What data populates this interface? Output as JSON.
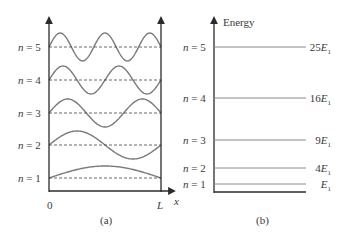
{
  "panel_a": {
    "caption": "(a)",
    "x_origin_label": "0",
    "x_end_label": "L",
    "x_axis_label": "x",
    "levels": [
      {
        "n": 1,
        "label_n": "n",
        "label_eq": " = 1",
        "baseline_y": 178,
        "half_waves": 1,
        "amplitude": 12
      },
      {
        "n": 2,
        "label_n": "n",
        "label_eq": " = 2",
        "baseline_y": 145,
        "half_waves": 2,
        "amplitude": 14
      },
      {
        "n": 3,
        "label_n": "n",
        "label_eq": " = 3",
        "baseline_y": 113,
        "half_waves": 3,
        "amplitude": 14
      },
      {
        "n": 4,
        "label_n": "n",
        "label_eq": " = 4",
        "baseline_y": 80,
        "half_waves": 4,
        "amplitude": 14
      },
      {
        "n": 5,
        "label_n": "n",
        "label_eq": " = 5",
        "baseline_y": 47,
        "half_waves": 5,
        "amplitude": 14
      }
    ]
  },
  "panel_b": {
    "caption": "(b)",
    "axis_label": "Energy",
    "levels": [
      {
        "n": 1,
        "label_n": "n",
        "label_eq": " = 1",
        "energy_coef": "",
        "energy_sym": "E",
        "energy_sub": "1",
        "y": 184
      },
      {
        "n": 2,
        "label_n": "n",
        "label_eq": " = 2",
        "energy_coef": "4",
        "energy_sym": "E",
        "energy_sub": "1",
        "y": 168
      },
      {
        "n": 3,
        "label_n": "n",
        "label_eq": " = 3",
        "energy_coef": "9",
        "energy_sym": "E",
        "energy_sub": "1",
        "y": 140
      },
      {
        "n": 4,
        "label_n": "n",
        "label_eq": " = 4",
        "energy_coef": "16",
        "energy_sym": "E",
        "energy_sub": "1",
        "y": 98
      },
      {
        "n": 5,
        "label_n": "n",
        "label_eq": " = 5",
        "energy_coef": "25",
        "energy_sym": "E",
        "energy_sub": "1",
        "y": 47
      }
    ]
  },
  "colors": {
    "wave": "#7a7a7a",
    "axis": "#2b2b2b",
    "dashed": "#444444",
    "level_line": "#8a8a8a",
    "text": "#3a3a3a"
  }
}
